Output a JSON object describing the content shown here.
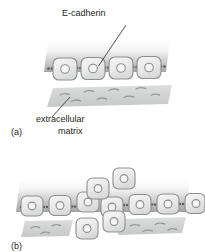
{
  "figure": {
    "title_alt": "Epithelial cell adhesion and E-cadherin loss diagram",
    "panels": [
      {
        "id": "a",
        "label": "(a)",
        "description": "Intact epithelial sheet: four cells joined by E-cadherin junctions resting on extracellular matrix",
        "cell_count": 4,
        "junction_count": 5,
        "has_matrix": true
      },
      {
        "id": "b",
        "label": "(b)",
        "description": "Loss of E-cadherin: cells detach from the sheet and migrate away",
        "cell_count_attached": 6,
        "cell_count_detached": 4,
        "junction_count": 4,
        "has_matrix": true
      }
    ],
    "annotations": {
      "ecadherin": "E-cadherin",
      "extracellular": "extracellular",
      "matrix": "matrix"
    },
    "colors": {
      "text": "#231f20",
      "cell_fill": "#e9eae9",
      "cell_stroke": "#8d8f8e",
      "nucleus_stroke": "#8d8f8e",
      "nucleus_fill": "#f4f5f4",
      "junction": "#5a5c5b",
      "band_top": "#fdfdfd",
      "band_bottom": "#a9abaa",
      "matrix_fill": "#d2d4d3",
      "matrix_fiber": "#9a9c9b",
      "leader": "#3a3a3a"
    }
  }
}
